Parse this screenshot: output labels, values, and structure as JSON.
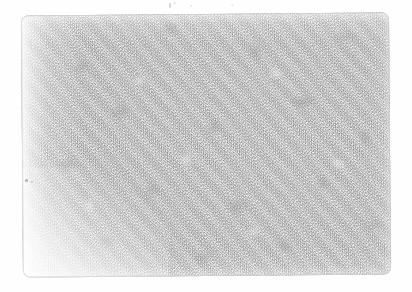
{
  "image": {
    "kind": "scanned-texture-photograph",
    "subject_label": "Mottled grayscale fiber texture",
    "orientation": "landscape",
    "width_px": 412,
    "height_px": 292,
    "background_color": "#ffffff",
    "rotation_deg": -0.45
  },
  "plate": {
    "label": "Textured field",
    "left_px": 22,
    "top_px": 14,
    "width_px": 368,
    "height_px": 262,
    "corner_radius_px": 7,
    "base_color": "#d2d2d2",
    "light_tone": "#efefef",
    "mid_tone": "#c9c9c9",
    "dark_tone": "#9a9a9a",
    "outline_color": "#c8c8c8"
  },
  "fades": {
    "left_label": "Left edge scan fade",
    "bottom_left_label": "Bottom-left corner fade",
    "top_label": "Top edge fade",
    "bottom_label": "Bottom edge fade",
    "right_label": "Right edge fade",
    "fade_color": "#ffffff"
  },
  "artifacts": {
    "scan_line_label": "Left vertical scan line",
    "scan_line_color": "#d0d0d0",
    "specks": [
      {
        "label": "speck-top-1"
      },
      {
        "label": "speck-top-2"
      },
      {
        "label": "speck-top-3"
      },
      {
        "label": "speck-top-4"
      },
      {
        "label": "speck-left-1"
      },
      {
        "label": "speck-left-2"
      }
    ]
  }
}
